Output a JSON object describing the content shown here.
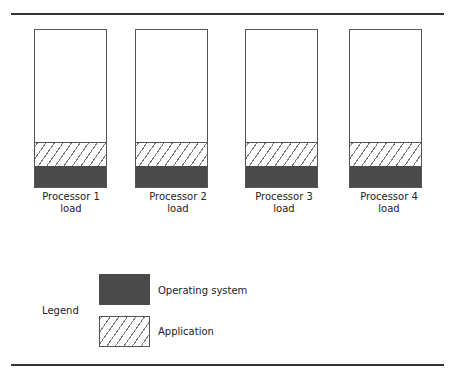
{
  "diagram": {
    "type": "processor-load-comparison",
    "processors": [
      {
        "label_line1": "Processor 1",
        "label_line2": "load"
      },
      {
        "label_line1": "Processor 2",
        "label_line2": "load"
      },
      {
        "label_line1": "Processor 3",
        "label_line2": "load"
      },
      {
        "label_line1": "Processor 4",
        "label_line2": "load"
      }
    ],
    "legend": {
      "title": "Legend",
      "items": [
        {
          "label": "Operating system",
          "style": "solid-dark",
          "color": "#4a4a4a"
        },
        {
          "label": "Application",
          "style": "hatched"
        }
      ]
    }
  }
}
